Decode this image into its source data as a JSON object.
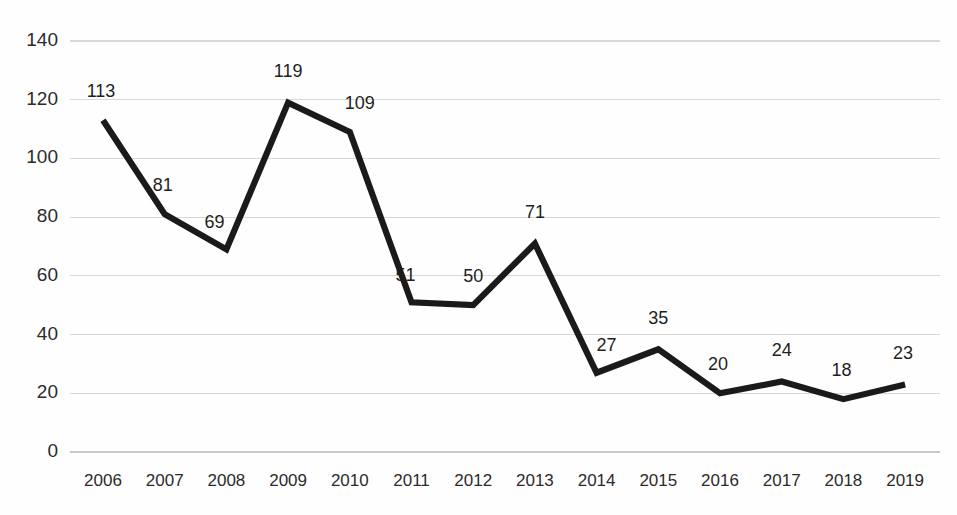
{
  "chart_data": {
    "type": "line",
    "title": "",
    "subtitle": "",
    "xlabel": "",
    "ylabel": "",
    "categories": [
      "2006",
      "2007",
      "2008",
      "2009",
      "2010",
      "2011",
      "2012",
      "2013",
      "2014",
      "2015",
      "2016",
      "2017",
      "2018",
      "2019"
    ],
    "values": [
      113,
      81,
      69,
      119,
      109,
      51,
      50,
      71,
      27,
      35,
      20,
      24,
      18,
      23
    ],
    "point_labels": [
      "113",
      "81",
      "69",
      "119",
      "109",
      "51",
      "50",
      "71",
      "27",
      "35",
      "20",
      "24",
      "18",
      "23"
    ],
    "series": [
      {
        "name": "",
        "values": [
          113,
          81,
          69,
          119,
          109,
          51,
          50,
          71,
          27,
          35,
          20,
          24,
          18,
          23
        ]
      }
    ],
    "ylim": [
      0,
      140
    ],
    "xlim_categories": [
      "2006",
      "2019"
    ],
    "y_ticks": [
      0,
      20,
      40,
      60,
      80,
      100,
      120,
      140
    ],
    "y_tick_labels": [
      "0",
      "20",
      "40",
      "60",
      "80",
      "100",
      "120",
      "140"
    ],
    "x_tick_labels": [
      "2006",
      "2007",
      "2008",
      "2009",
      "2010",
      "2011",
      "2012",
      "2013",
      "2014",
      "2015",
      "2016",
      "2017",
      "2018",
      "2019"
    ],
    "grid": {
      "horizontal": true,
      "vertical": false
    },
    "legend": {
      "visible": false,
      "position": "none"
    },
    "markers": false,
    "data_labels_visible": true,
    "colors": {
      "line": "#1a1a1a",
      "gridline": "#d8d8d8",
      "background": "#fefefe",
      "tick_text": "#2b2b2b",
      "label_text": "#1f1f1f"
    },
    "label_offsets": [
      {
        "dx": -2,
        "dy": -28
      },
      {
        "dx": -2,
        "dy": -28
      },
      {
        "dx": -12,
        "dy": -26
      },
      {
        "dx": 0,
        "dy": -30
      },
      {
        "dx": 10,
        "dy": -28
      },
      {
        "dx": -6,
        "dy": -26
      },
      {
        "dx": 0,
        "dy": -28
      },
      {
        "dx": 0,
        "dy": -30
      },
      {
        "dx": 10,
        "dy": -26
      },
      {
        "dx": 0,
        "dy": -30
      },
      {
        "dx": -2,
        "dy": -28
      },
      {
        "dx": 0,
        "dy": -30
      },
      {
        "dx": -2,
        "dy": -28
      },
      {
        "dx": -2,
        "dy": -30
      }
    ]
  },
  "geometry": {
    "plot_left": 70,
    "plot_right": 940,
    "y_top_px": 41,
    "y_bottom_px": 452,
    "first_x_px": 103,
    "x_step_px": 61.7,
    "x_axis_label_y": 482
  }
}
